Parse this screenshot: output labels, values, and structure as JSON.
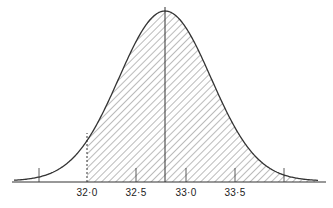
{
  "figure": {
    "type": "normal-distribution-curve",
    "shaded_region": {
      "from": 32.0,
      "to": "right tail end",
      "pattern": "diagonal-hatch"
    },
    "mean_line": 32.8,
    "axis": {
      "tick_labels": [
        "32·0",
        "32·5",
        "33·0",
        "33·5"
      ],
      "unlabeled_ticks": [
        31.5,
        34.0
      ]
    },
    "colors": {
      "line": "#333333",
      "background": "#ffffff"
    }
  }
}
